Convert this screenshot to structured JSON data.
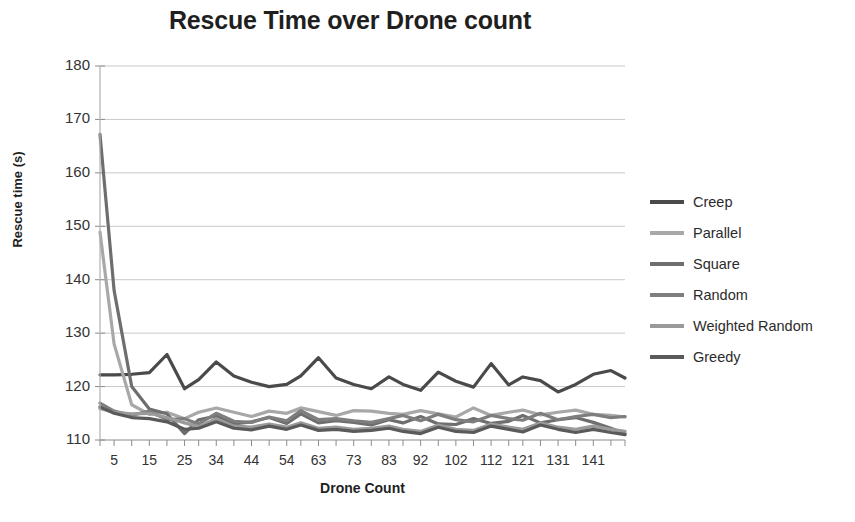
{
  "chart_data": {
    "type": "line",
    "title": "Rescue Time over Drone count",
    "xlabel": "Drone Count",
    "ylabel": "Rescue time (s)",
    "xlim": [
      1,
      150
    ],
    "ylim": [
      110,
      180
    ],
    "ytick_values": [
      110,
      120,
      130,
      140,
      150,
      160,
      170,
      180
    ],
    "ytick_labels": [
      "110",
      "120",
      "130",
      "140",
      "150",
      "160",
      "170",
      "180"
    ],
    "xtick_labels": [
      "5",
      "15",
      "25",
      "34",
      "44",
      "54",
      "63",
      "73",
      "83",
      "92",
      "102",
      "112",
      "121",
      "131",
      "141"
    ],
    "grid": "horizontal",
    "legend_position": "right",
    "x": [
      1,
      5,
      10,
      15,
      20,
      25,
      29,
      34,
      39,
      44,
      49,
      54,
      58,
      63,
      68,
      73,
      78,
      83,
      87,
      92,
      97,
      102,
      107,
      112,
      117,
      121,
      126,
      131,
      136,
      141,
      146,
      150
    ],
    "series": [
      {
        "name": "Creep",
        "color": "#4a4a4a",
        "values": [
          122.2,
          122.2,
          122.3,
          122.6,
          126.0,
          119.6,
          121.3,
          124.6,
          122.0,
          120.8,
          120.0,
          120.4,
          122.0,
          125.4,
          121.6,
          120.4,
          119.6,
          121.8,
          120.4,
          119.3,
          122.7,
          121.0,
          119.9,
          124.3,
          120.3,
          121.8,
          121.1,
          119.0,
          120.4,
          122.3,
          123.0,
          121.6
        ]
      },
      {
        "name": "Parallel",
        "color": "#a8a8a8",
        "values": [
          148.9,
          128.0,
          116.6,
          114.8,
          115.2,
          114.0,
          115.2,
          116.0,
          115.2,
          114.4,
          115.4,
          115.0,
          116.0,
          115.3,
          114.6,
          115.5,
          115.4,
          115.0,
          114.8,
          115.5,
          114.9,
          114.3,
          116.0,
          114.6,
          115.2,
          115.6,
          114.7,
          115.2,
          115.6,
          114.8,
          114.6,
          114.3
        ]
      },
      {
        "name": "Square",
        "color": "#6e6e6e",
        "values": [
          167.2,
          138.0,
          120.0,
          115.8,
          114.9,
          111.2,
          113.8,
          114.5,
          113.0,
          113.4,
          114.2,
          113.1,
          114.9,
          113.2,
          113.6,
          113.3,
          112.8,
          113.8,
          113.2,
          114.4,
          113.0,
          112.9,
          114.0,
          113.1,
          113.5,
          114.6,
          113.2,
          113.8,
          114.2,
          113.3,
          112.2,
          111.2
        ]
      },
      {
        "name": "Random",
        "color": "#7e7e7e",
        "values": [
          116.9,
          115.4,
          114.6,
          115.4,
          113.8,
          114.0,
          113.0,
          115.0,
          113.5,
          113.3,
          114.3,
          113.6,
          115.5,
          113.8,
          114.0,
          113.6,
          113.3,
          114.0,
          114.6,
          113.6,
          114.8,
          113.8,
          113.4,
          114.6,
          114.0,
          113.7,
          115.0,
          113.8,
          114.4,
          114.8,
          114.2,
          114.4
        ]
      },
      {
        "name": "Weighted Random",
        "color": "#9a9a9a",
        "values": [
          115.9,
          115.2,
          114.9,
          115.0,
          114.2,
          113.2,
          112.5,
          114.0,
          112.6,
          112.4,
          113.0,
          112.4,
          113.2,
          112.2,
          112.4,
          112.0,
          112.2,
          112.6,
          112.0,
          111.6,
          112.8,
          112.0,
          111.8,
          113.0,
          112.4,
          112.0,
          113.2,
          112.4,
          112.0,
          112.6,
          112.0,
          111.6
        ]
      },
      {
        "name": "Greedy",
        "color": "#5a5a5a",
        "values": [
          116.2,
          115.0,
          114.2,
          114.0,
          113.4,
          112.0,
          112.2,
          113.4,
          112.2,
          111.9,
          112.6,
          112.0,
          112.8,
          111.8,
          112.0,
          111.6,
          111.8,
          112.2,
          111.6,
          111.2,
          112.4,
          111.6,
          111.4,
          112.6,
          112.0,
          111.5,
          112.8,
          112.0,
          111.4,
          112.0,
          111.4,
          111.0
        ]
      }
    ]
  },
  "legend": {
    "items": [
      {
        "label": "Creep",
        "color": "#4a4a4a"
      },
      {
        "label": "Parallel",
        "color": "#a8a8a8"
      },
      {
        "label": "Square",
        "color": "#6e6e6e"
      },
      {
        "label": "Random",
        "color": "#7e7e7e"
      },
      {
        "label": "Weighted Random",
        "color": "#9a9a9a"
      },
      {
        "label": "Greedy",
        "color": "#5a5a5a"
      }
    ]
  },
  "colors": {
    "axis": "#b0b0b0",
    "grid": "#c9c9c9",
    "text": "#2b2b2b",
    "background": "#ffffff"
  }
}
